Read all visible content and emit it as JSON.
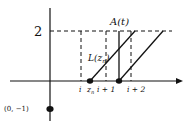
{
  "diagram": {
    "y_axis_label_level": "2",
    "curve_label": "A(t)",
    "line_label": "L(z",
    "line_label_sub": "n",
    "line_label_close": ")",
    "tick_labels": {
      "i": "i",
      "zn": "z",
      "zn_sub": "n",
      "i_plus_1": "i + 1",
      "i_plus_2": "i + 2"
    },
    "point_label": "(0, −1)",
    "colors": {
      "stroke": "#111111",
      "background": "#ffffff"
    }
  }
}
